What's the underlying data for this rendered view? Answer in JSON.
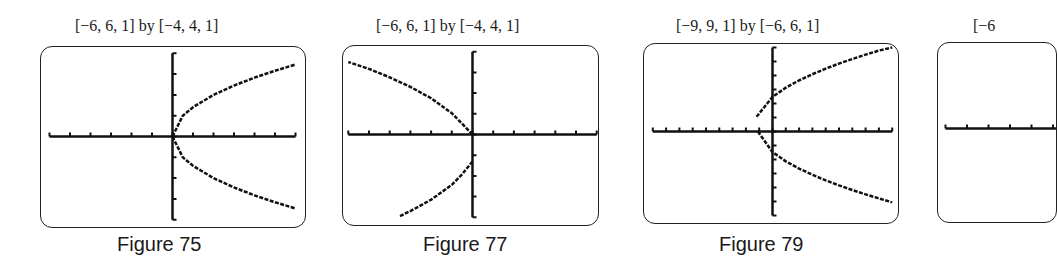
{
  "chart_data": [
    {
      "type": "line",
      "title": "[−6, 6, 1] by [−4, 4, 1]",
      "caption": "Figure 75",
      "xlim": [
        -6,
        6
      ],
      "xscl": 1,
      "ylim": [
        -4,
        4
      ],
      "yscl": 1,
      "grid": false,
      "curve": "x = y^2 / 2 (parabola opening right, vertex (0,0))",
      "series": [
        {
          "name": "upper",
          "x": [
            0,
            0.5,
            1,
            2,
            3,
            4,
            5,
            6
          ],
          "y": [
            0,
            1.0,
            1.41,
            2.0,
            2.45,
            2.83,
            3.16,
            3.46
          ]
        },
        {
          "name": "lower",
          "x": [
            0,
            0.5,
            1,
            2,
            3,
            4,
            5,
            6
          ],
          "y": [
            0,
            -1.0,
            -1.41,
            -2.0,
            -2.45,
            -2.83,
            -3.16,
            -3.46
          ]
        }
      ]
    },
    {
      "type": "line",
      "title": "[−6, 6, 1] by [−4, 4, 1]",
      "caption": "Figure 77",
      "xlim": [
        -6,
        6
      ],
      "xscl": 1,
      "ylim": [
        -4,
        4
      ],
      "yscl": 1,
      "grid": false,
      "curve": "parabola opening left, vertex near (0, −0.7)",
      "series": [
        {
          "name": "upper",
          "x": [
            0,
            -0.5,
            -1,
            -2,
            -3,
            -4,
            -5,
            -6
          ],
          "y": [
            0.0,
            0.52,
            1.03,
            1.75,
            2.3,
            2.76,
            3.17,
            3.5
          ]
        },
        {
          "name": "lower",
          "x": [
            0,
            -0.5,
            -1,
            -2,
            -3,
            -3.5
          ],
          "y": [
            -1.3,
            -1.92,
            -2.43,
            -3.15,
            -3.7,
            -3.94
          ]
        }
      ]
    },
    {
      "type": "line",
      "title": "[−9, 9, 1] by [−6, 6, 1]",
      "caption": "Figure 79",
      "xlim": [
        -9,
        9
      ],
      "xscl": 1,
      "ylim": [
        -6,
        6
      ],
      "yscl": 1,
      "grid": false,
      "curve": "x = (y − 0.5)^2 / 3 − 1.3 (parabola opening right)",
      "series": [
        {
          "name": "upper",
          "x": [
            -1.2,
            0,
            1,
            2,
            3,
            4,
            5,
            6,
            7,
            8,
            9
          ],
          "y": [
            1.05,
            2.47,
            3.13,
            3.65,
            4.09,
            4.49,
            4.85,
            5.18,
            5.49,
            5.78,
            6.0
          ]
        },
        {
          "name": "lower",
          "x": [
            -1.1,
            0,
            1,
            2,
            3,
            4,
            5,
            6,
            7,
            8,
            9
          ],
          "y": [
            0.0,
            -1.47,
            -2.13,
            -2.65,
            -3.09,
            -3.49,
            -3.85,
            -4.18,
            -4.49,
            -4.78,
            -5.06
          ]
        }
      ]
    },
    {
      "type": "line",
      "title": "[−6",
      "caption": "",
      "xlim": [
        -6,
        6
      ],
      "xscl": 1,
      "ylim": [
        -4,
        4
      ],
      "yscl": 1,
      "grid": false,
      "partial": true,
      "series": []
    }
  ],
  "layout": [
    {
      "box": {
        "left": 40,
        "top": 46,
        "width": 266,
        "height": 182
      },
      "title_left": 75,
      "caption_left": 117,
      "axis_origin": [
        133,
        91
      ],
      "px_per_unit_x": 20.5,
      "px_per_unit_y": 20.8
    },
    {
      "box": {
        "left": 342,
        "top": 45,
        "width": 257,
        "height": 181
      },
      "title_left": 376,
      "caption_left": 423,
      "axis_origin": [
        131,
        90
      ],
      "px_per_unit_x": 20.7,
      "px_per_unit_y": 20.7
    },
    {
      "box": {
        "left": 643,
        "top": 43,
        "width": 256,
        "height": 181
      },
      "title_left": 676,
      "caption_left": 719,
      "axis_origin": [
        130,
        89
      ],
      "px_per_unit_x": 13.3,
      "px_per_unit_y": 14.0
    },
    {
      "box": {
        "left": 937,
        "top": 42,
        "width": 120,
        "height": 181
      },
      "title_left": 973,
      "caption_left": 0,
      "axis_origin": [
        138,
        87
      ],
      "px_per_unit_x": 21.5,
      "px_per_unit_y": 20.8
    }
  ]
}
